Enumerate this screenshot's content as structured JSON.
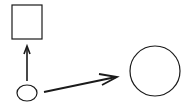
{
  "diagram": {
    "background": "#ffffff",
    "stroke_color": "#1a1a1a",
    "nodes": [
      {
        "id": "square",
        "shape": "rectangle",
        "x": 12,
        "y": 5,
        "width": 30,
        "height": 34
      },
      {
        "id": "small-ellipse",
        "shape": "ellipse",
        "cx": 27,
        "cy": 93,
        "rx": 10,
        "ry": 8
      },
      {
        "id": "large-circle",
        "shape": "circle",
        "cx": 155,
        "cy": 71,
        "r": 25
      }
    ],
    "edges": [
      {
        "from": "small-ellipse",
        "to": "square",
        "x1": 27,
        "y1": 81,
        "x2": 27,
        "y2": 46
      },
      {
        "from": "small-ellipse",
        "to": "large-circle",
        "x1": 44,
        "y1": 92,
        "x2": 117,
        "y2": 77
      }
    ]
  }
}
